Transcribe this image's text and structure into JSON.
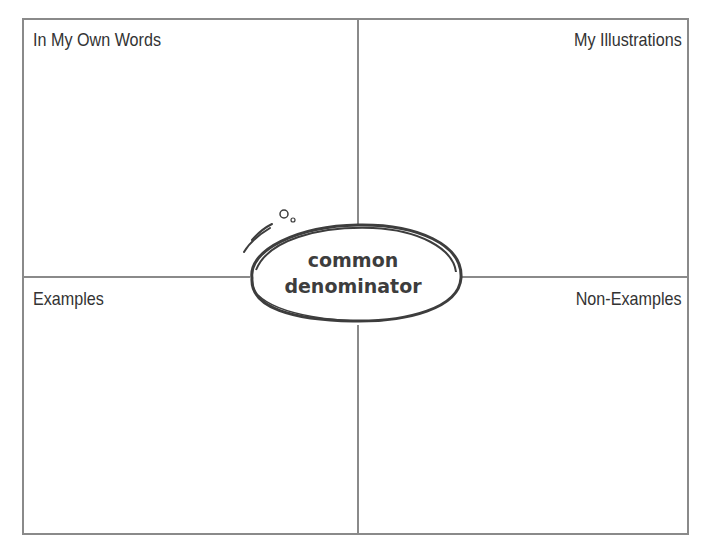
{
  "organizer": {
    "type": "Frayer model",
    "term_lines": [
      "common",
      "denominator"
    ],
    "quadrants": {
      "top_left": "In My Own Words",
      "top_right": "My Illustrations",
      "bottom_left": "Examples",
      "bottom_right": "Non-Examples"
    },
    "colors": {
      "border": "#8a8a8a",
      "text": "#333333",
      "ellipse": "#3d3d3d"
    }
  }
}
